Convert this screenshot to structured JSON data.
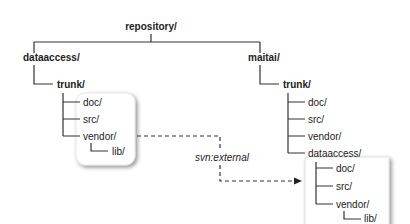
{
  "diagram": {
    "root": "repository/",
    "left": {
      "project": "dataaccess/",
      "trunk": "trunk/",
      "children": [
        "doc/",
        "src/",
        "vendor/"
      ],
      "vendor_child": "lib/"
    },
    "right": {
      "project": "maitai/",
      "trunk": "trunk/",
      "children": [
        "doc/",
        "src/",
        "vendor/",
        "dataaccess/"
      ],
      "external": {
        "children": [
          "doc/",
          "src/",
          "vendor/"
        ],
        "vendor_child": "lib/"
      }
    },
    "link_label": "svn:external"
  }
}
